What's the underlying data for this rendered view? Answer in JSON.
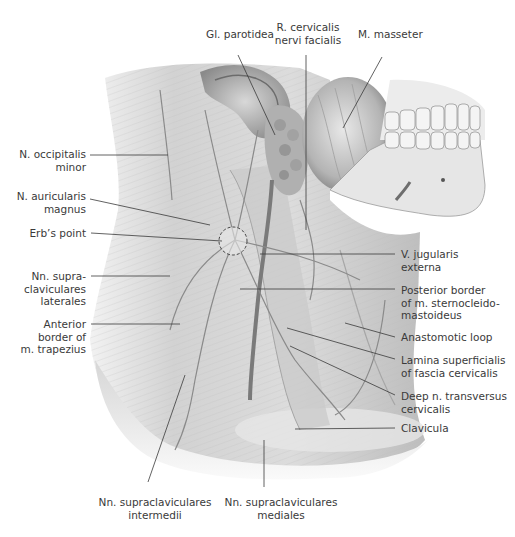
{
  "figure": {
    "colors": {
      "background": "#ffffff",
      "skin_tone_light": "#e4e4e4",
      "skin_tone_mid": "#c8c8c8",
      "shadow": "#9a9a9a",
      "nerve": "#8e8e8e",
      "vein": "#707070",
      "leader_line": "#3a3a3a",
      "label_text": "#3a3a3a"
    }
  },
  "labels": {
    "top": [
      {
        "id": "gl-parotidea",
        "text": "Gl. parotidea"
      },
      {
        "id": "r-cervicalis",
        "text": "R. cervicalis\nnervi facialis"
      },
      {
        "id": "m-masseter",
        "text": "M. masseter"
      }
    ],
    "left": [
      {
        "id": "n-occipitalis-minor",
        "text": "N. occipitalis\nminor"
      },
      {
        "id": "n-auricularis-magnus",
        "text": "N. auricularis\nmagnus"
      },
      {
        "id": "erbs-point",
        "text": "Erb’s point"
      },
      {
        "id": "nn-supraclav-laterales",
        "text": "Nn. supra-\nclaviculares\nlaterales"
      },
      {
        "id": "anterior-border-trapezius",
        "text": "Anterior\nborder of\nm. trapezius"
      }
    ],
    "right": [
      {
        "id": "v-jugularis-externa",
        "text": "V. jugularis\nexterna"
      },
      {
        "id": "posterior-border-scm",
        "text": "Posterior border\nof m. sternocleido-\nmastoideus"
      },
      {
        "id": "anastomotic-loop",
        "text": "Anastomotic loop"
      },
      {
        "id": "lamina-superficialis",
        "text": "Lamina superficialis\nof fascia cervicalis"
      },
      {
        "id": "deep-n-transversus",
        "text": "Deep n. transversus\ncervicalis"
      },
      {
        "id": "clavicula",
        "text": "Clavicula"
      }
    ],
    "bottom": [
      {
        "id": "nn-supraclav-intermedii",
        "text": "Nn. supraclaviculares\nintermedii"
      },
      {
        "id": "nn-supraclav-mediales",
        "text": "Nn. supraclaviculares\nmediales"
      }
    ]
  }
}
